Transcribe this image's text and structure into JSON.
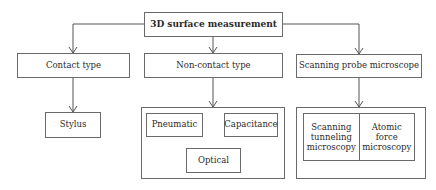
{
  "diagram": {
    "root": {
      "label": "3D surface measurement"
    },
    "categories": [
      {
        "label": "Contact type"
      },
      {
        "label": "Non-contact type"
      },
      {
        "label": "Scanning probe microscope"
      }
    ],
    "contact_children": [
      {
        "label": "Stylus"
      }
    ],
    "noncontact_children": [
      {
        "label": "Pneumatic"
      },
      {
        "label": "Capacitance"
      },
      {
        "label": "Optical"
      }
    ],
    "spm_children": [
      {
        "label": "Scanning\ntunneling\nmicroscopy"
      },
      {
        "label": "Atomic\nforce\nmicroscopy"
      }
    ],
    "colors": {
      "line": "#555555",
      "border": "#6a6a6a",
      "text": "#2a2a2a"
    }
  }
}
